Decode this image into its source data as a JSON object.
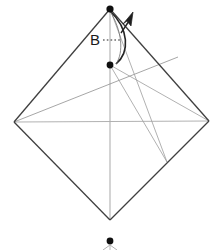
{
  "figure": {
    "type": "origami-fold-diagram",
    "title": "",
    "background_color": "#ffffff",
    "width": 214,
    "height": 250
  },
  "labels": [
    {
      "id": "label-b",
      "text": "B",
      "x": 95,
      "y": 40,
      "leader": "dotted-line-right"
    }
  ],
  "colors": {
    "outline": "#3a3a3a",
    "crease": "#9a9a9a",
    "fold_crease": "#b4b4b4",
    "dot": "#111111",
    "arrow": "#222222",
    "label": "#1a1a1a"
  },
  "points": [
    {
      "name": "top-vertex",
      "x": 110,
      "y": 9,
      "marked": true
    },
    {
      "name": "left-vertex",
      "x": 14,
      "y": 122,
      "marked": false
    },
    {
      "name": "right-vertex",
      "x": 209,
      "y": 121,
      "marked": false
    },
    {
      "name": "bottom-vertex",
      "x": 110,
      "y": 220,
      "marked": false
    },
    {
      "name": "mid-point-b",
      "x": 110,
      "y": 65,
      "marked": true
    },
    {
      "name": "lower-right-crease-node",
      "x": 167,
      "y": 162,
      "marked": false
    },
    {
      "name": "below-figure-dot",
      "x": 110,
      "y": 241,
      "marked": true
    }
  ],
  "edges": [
    {
      "name": "edge-top-left",
      "from": "top-vertex",
      "to": "left-vertex",
      "style": "outline"
    },
    {
      "name": "edge-top-right",
      "from": "top-vertex",
      "to": "right-vertex",
      "style": "outline"
    },
    {
      "name": "edge-bottom-left",
      "from": "left-vertex",
      "to": "bottom-vertex",
      "style": "outline"
    },
    {
      "name": "edge-bottom-right",
      "from": "right-vertex",
      "to": "bottom-vertex",
      "style": "outline"
    }
  ],
  "creases": [
    {
      "name": "crease-horizontal-diagonal",
      "x1": 14,
      "y1": 122,
      "x2": 209,
      "y2": 121
    },
    {
      "name": "crease-vertical-axis",
      "x1": 110,
      "y1": 9,
      "x2": 110,
      "y2": 220
    },
    {
      "name": "crease-left-to-upper-right",
      "x1": 14,
      "y1": 122,
      "x2": 178,
      "y2": 57
    },
    {
      "name": "crease-midpoint-to-right",
      "x1": 110,
      "y1": 65,
      "x2": 209,
      "y2": 121
    },
    {
      "name": "crease-top-to-node",
      "x1": 110,
      "y1": 9,
      "x2": 167,
      "y2": 162
    },
    {
      "name": "crease-midpoint-to-node",
      "x1": 110,
      "y1": 65,
      "x2": 167,
      "y2": 162
    }
  ],
  "arrow": {
    "name": "fold-rotation-arrow",
    "kind": "curved-valley-fold",
    "path": "M 110 11 C 128 30 129 52 116 64",
    "head_x": 129,
    "head_y": 16
  },
  "leader": {
    "name": "label-b-leader",
    "x1": 103,
    "y1": 40,
    "x2": 121,
    "y2": 40,
    "dash": "1.6 2.2"
  },
  "below_marks": {
    "name": "below-figure-partial-lines",
    "lines": [
      {
        "x1": 110,
        "y1": 244,
        "x2": 103,
        "y2": 250
      },
      {
        "x1": 110,
        "y1": 244,
        "x2": 117,
        "y2": 250
      },
      {
        "x1": 110,
        "y1": 244,
        "x2": 110,
        "y2": 250
      }
    ]
  }
}
